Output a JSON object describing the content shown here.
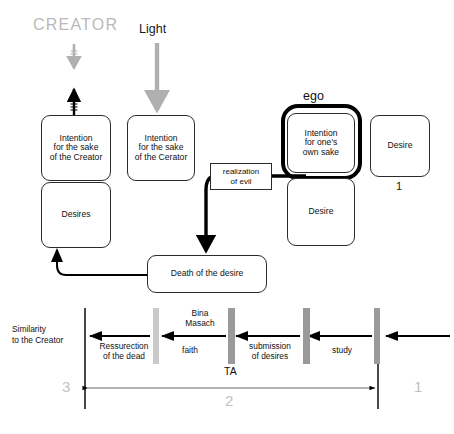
{
  "diagram": {
    "title_creator": "CREATOR",
    "title_light": "Light",
    "ego_label": "ego",
    "colors": {
      "creator_text": "#b9b9b9",
      "light_arrow": "#b0b0b0",
      "ego_outline": "#000000",
      "bar_light": "#c9c9c9",
      "bar_dark": "#9a9a9a",
      "number_gray": "#c2c2c2",
      "box_border": "#2b2b2b"
    },
    "nodes": {
      "intention_creator_1": "Intention\nfor the sake\nof the Creator",
      "desires": "Desires",
      "intention_creator_2": "Intention\nfor the sake\nof the Cerator",
      "realization_of_evil": "realization\nof evil",
      "intention_own_sake": "Intention\nfor one's\nown sake",
      "desire_ego": "Desire",
      "desire_right": "Desire",
      "desire_right_number": "1",
      "death_of_desire": "Death of the desire"
    },
    "timeline": {
      "axis_left_label": "Similarity\nto the Creator",
      "stage_labels": [
        "Ressurection\nof the dead",
        "faith",
        "submission\nof desires",
        "study"
      ],
      "bina_masach": "Bina\nMasach",
      "ta": "TA",
      "marker_left": "3",
      "marker_span": "2",
      "marker_right": "1"
    }
  }
}
